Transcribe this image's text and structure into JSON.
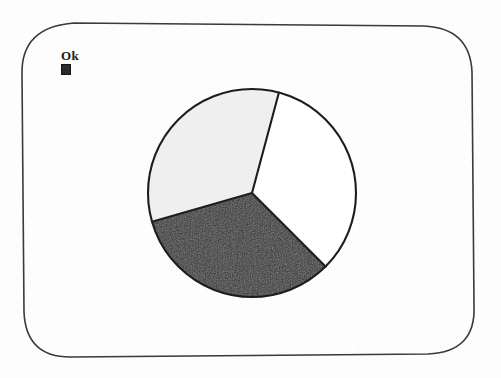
{
  "screen": {
    "background_color": "#fdfdfd",
    "bezel_color": "#3a3a3a",
    "width": 501,
    "height": 378
  },
  "ok_prompt": {
    "label": "Ok",
    "cursor_icon": "filled-square-cursor",
    "cursor_color": "#2b2b2b"
  },
  "chart_data": {
    "type": "pie",
    "title": "",
    "subtitle": "",
    "xlabel": "",
    "ylabel": "",
    "grid": false,
    "legend_position": "none",
    "annotations": [],
    "center": {
      "x": 110,
      "y": 110
    },
    "radius": 104,
    "outline_color": "#1e1e1e",
    "outline_width": 2,
    "start_angle_deg": 15,
    "categories": [
      "Slice 1",
      "Slice 2",
      "Slice 3"
    ],
    "values": [
      33.3,
      33.1,
      33.6
    ],
    "slices": [
      {
        "name": "Slice 1",
        "value": 33.3,
        "percent": 33.3,
        "angle_deg": 120,
        "start_deg": 15,
        "end_deg": 135,
        "fill": "#ffffff",
        "fill_name": "white"
      },
      {
        "name": "Slice 2",
        "value": 33.1,
        "percent": 33.1,
        "angle_deg": 119,
        "start_deg": 135,
        "end_deg": 254,
        "fill": "#2c2c2c",
        "fill_name": "dark"
      },
      {
        "name": "Slice 3",
        "value": 33.6,
        "percent": 33.6,
        "angle_deg": 121,
        "start_deg": 254,
        "end_deg": 375,
        "fill": "#efefef",
        "fill_name": "light-gray"
      }
    ]
  }
}
